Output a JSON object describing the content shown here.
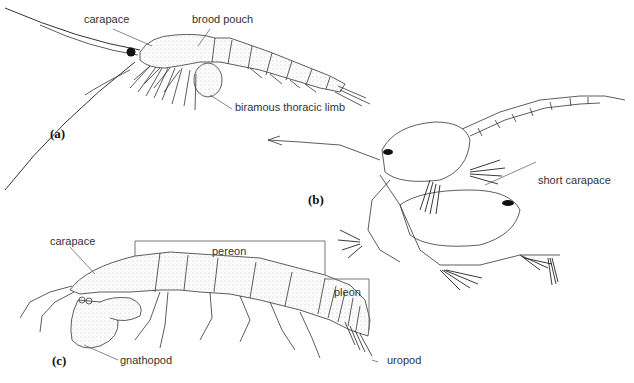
{
  "figure": {
    "panels": [
      {
        "id": "a",
        "label": "(a)",
        "annotations": [
          "carapace",
          "brood pouch",
          "biramous thoracic limb"
        ]
      },
      {
        "id": "b",
        "label": "(b)",
        "annotations": [
          "short carapace"
        ]
      },
      {
        "id": "c",
        "label": "(c)",
        "annotations": [
          "carapace",
          "pereon",
          "pleon",
          "gnathopod",
          "uropod"
        ]
      }
    ]
  },
  "labels": {
    "a_carapace": "carapace",
    "a_brood_pouch": "brood pouch",
    "a_biramous": "biramous thoracic limb",
    "a_panel": "(a)",
    "b_short_carapace": "short carapace",
    "b_panel": "(b)",
    "c_carapace": "carapace",
    "c_pereon": "pereon",
    "c_pleon": "pleon",
    "c_gnathopod": "gnathopod",
    "c_uropod": "uropod",
    "c_panel": "(c)"
  }
}
